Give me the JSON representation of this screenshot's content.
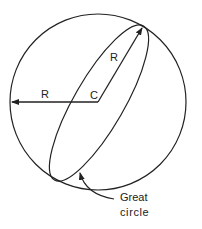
{
  "diagram": {
    "labels": {
      "center": "C",
      "radius_horizontal": "R",
      "radius_diagonal": "R",
      "great_circle_line1": "Great",
      "great_circle_line2": "circle"
    },
    "colors": {
      "stroke": "#222222",
      "background": "#ffffff"
    }
  }
}
